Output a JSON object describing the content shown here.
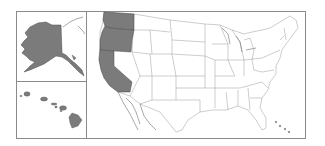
{
  "map": {
    "title": "",
    "subject": "United States state map with Alaska and Hawaii insets",
    "highlighted_states": [
      "Washington",
      "Oregon",
      "California",
      "Alaska",
      "Hawaii"
    ],
    "colors": {
      "highlight_fill": "#7b7b7b",
      "state_fill": "#ffffff",
      "border": "#9a9a9a",
      "frame": "#8a8a8a",
      "background": "#ffffff"
    },
    "insets": [
      {
        "name": "Alaska",
        "position": "top-left"
      },
      {
        "name": "Hawaii",
        "position": "bottom-left"
      }
    ],
    "main_panel": {
      "name": "Contiguous United States"
    }
  }
}
